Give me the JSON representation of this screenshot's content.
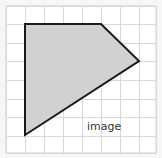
{
  "canvas": {
    "width": 162,
    "height": 158,
    "background": "#f6f6f6"
  },
  "grid": {
    "x0": 6,
    "y0": 6,
    "x1": 156,
    "y1": 153,
    "xs": [
      6,
      25,
      44,
      63,
      82,
      101,
      120,
      139,
      156
    ],
    "ys": [
      6,
      24,
      43,
      61,
      80,
      99,
      117,
      136,
      153
    ],
    "line_color": "#d8d8d8",
    "fill": "#ffffff",
    "border_color": "#cfcfcf"
  },
  "shape": {
    "type": "polygon",
    "points": [
      [
        25,
        24
      ],
      [
        101,
        24
      ],
      [
        139,
        61
      ],
      [
        25,
        135
      ]
    ],
    "fill": "#d1d1d1",
    "stroke": "#1a1a1a",
    "stroke_width": 2
  },
  "label": {
    "text": "image",
    "x": 87,
    "y": 121,
    "color": "#333333"
  }
}
